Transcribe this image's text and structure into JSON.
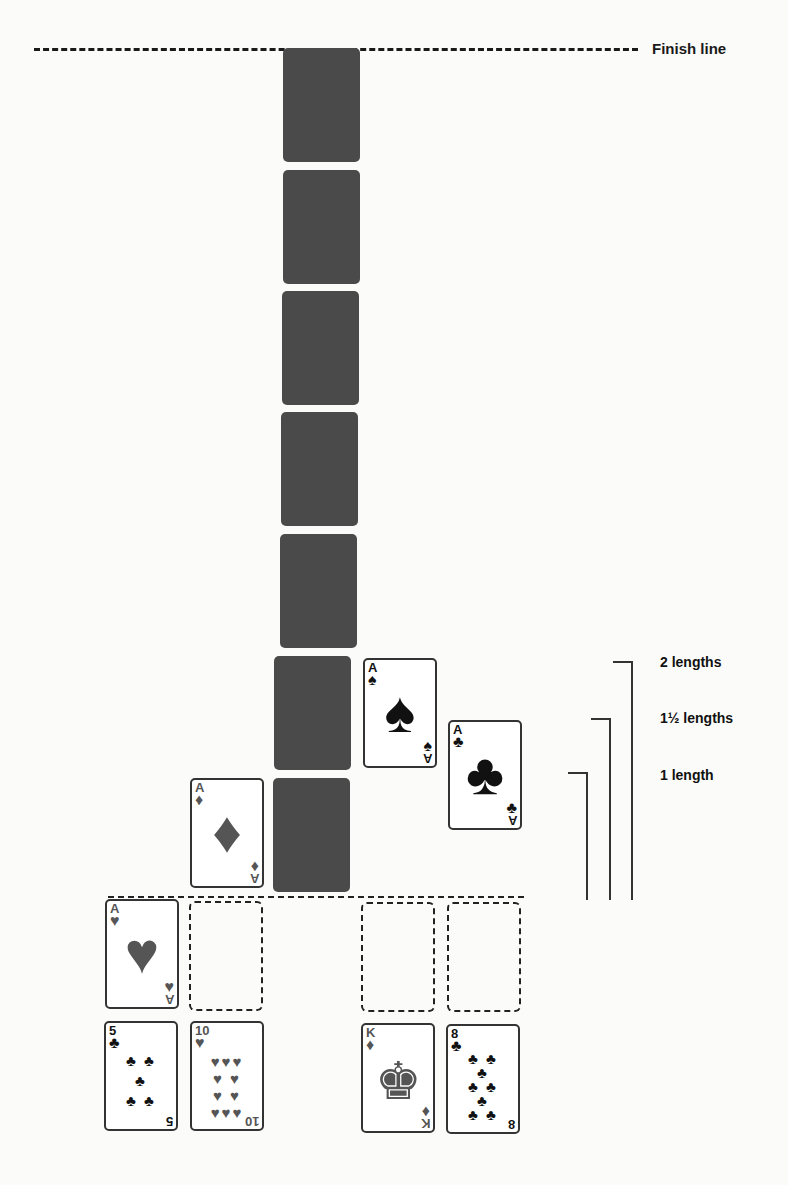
{
  "finish": {
    "label": "Finish line"
  },
  "track": {
    "card_backs": 7
  },
  "aces": [
    {
      "rank": "A",
      "suit": "♠",
      "name": "ace-of-spades",
      "color": "black"
    },
    {
      "rank": "A",
      "suit": "♣",
      "name": "ace-of-clubs",
      "color": "black"
    },
    {
      "rank": "A",
      "suit": "♦",
      "name": "ace-of-diamonds",
      "color": "red"
    },
    {
      "rank": "A",
      "suit": "♥",
      "name": "ace-of-hearts",
      "color": "red"
    }
  ],
  "bottom_row": [
    {
      "rank": "5",
      "suit": "♣",
      "pips": "♣ ♣\n♣\n♣ ♣"
    },
    {
      "rank": "10",
      "suit": "♥",
      "pips": "♥♥♥\n♥ ♥\n♥ ♥\n♥♥♥"
    },
    {
      "rank": "K",
      "suit": "♦",
      "pips": "♚"
    },
    {
      "rank": "8",
      "suit": "♣",
      "pips": "♣ ♣\n♣\n♣ ♣\n♣\n♣ ♣"
    }
  ],
  "lengths": [
    {
      "label": "2 lengths"
    },
    {
      "label": "1½ lengths"
    },
    {
      "label": "1 length"
    }
  ]
}
